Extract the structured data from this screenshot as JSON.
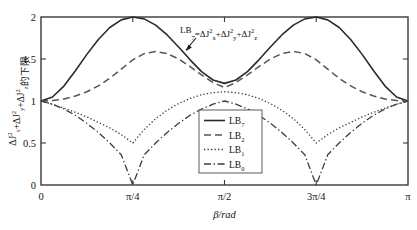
{
  "chart_data": {
    "type": "line",
    "title": "",
    "xlabel": "β/rad",
    "ylabel": "ΔJ²ₓ+ΔJ²ᵧ+ΔJ²ᵩ的下限",
    "ylabel_parts": {
      "term1_base": "ΔJ",
      "term1_sup": "2",
      "term1_sub": "x",
      "plus1": "+",
      "term2_base": "ΔJ",
      "term2_sup": "2",
      "term2_sub": "y",
      "plus2": "+",
      "term3_base": "ΔJ",
      "term3_sup": "2",
      "term3_sub": "z",
      "suffix": "的下限"
    },
    "xlim": [
      0,
      3.14159265
    ],
    "ylim": [
      0,
      2
    ],
    "xtick_values": [
      0,
      0.78539816,
      1.57079633,
      2.35619449,
      3.14159265
    ],
    "xtick_labels": [
      "0",
      "π/4",
      "π/2",
      "3π/4",
      "π"
    ],
    "ytick_values": [
      0,
      0.5,
      1,
      1.5,
      2
    ],
    "ytick_labels": [
      "0",
      "0.5",
      "1",
      "1.5",
      "2"
    ],
    "grid": false,
    "legend_position": "center",
    "annotation": {
      "text": "LB₇=ΔJ²ₓ+ΔJ²ᵧ+ΔJ²ᵩ",
      "parts": {
        "lhs_base": "LB",
        "lhs_sub": "7",
        "eq": "=",
        "t1_base": "ΔJ",
        "t1_sup": "2",
        "t1_sub": "x",
        "p1": "+",
        "t2_base": "ΔJ",
        "t2_sup": "2",
        "t2_sub": "y",
        "p2": "+",
        "t3_base": "ΔJ",
        "t3_sup": "2",
        "t3_sub": "z"
      }
    },
    "series": [
      {
        "name": "LB7",
        "label_base": "LB",
        "label_sub": "7",
        "style": "solid",
        "color": "#2b2b2b",
        "width": 1.6,
        "x": [
          0,
          0.0982,
          0.1963,
          0.2945,
          0.3927,
          0.4909,
          0.589,
          0.6872,
          0.7854,
          0.8836,
          0.9817,
          1.0799,
          1.1781,
          1.2763,
          1.3744,
          1.4726,
          1.5708,
          1.669,
          1.7671,
          1.8653,
          1.9635,
          2.0617,
          2.1598,
          2.258,
          2.3562,
          2.4544,
          2.5525,
          2.6507,
          2.7489,
          2.8471,
          2.9452,
          3.0434,
          3.1416
        ],
        "y": [
          1.0,
          1.048,
          1.178,
          1.36,
          1.555,
          1.733,
          1.875,
          1.966,
          2.0,
          1.978,
          1.903,
          1.786,
          1.643,
          1.49,
          1.35,
          1.25,
          1.21,
          1.25,
          1.35,
          1.49,
          1.643,
          1.786,
          1.903,
          1.978,
          2.0,
          1.966,
          1.875,
          1.733,
          1.555,
          1.36,
          1.178,
          1.048,
          1.0
        ]
      },
      {
        "name": "LB2",
        "label_base": "LB",
        "label_sub": "2",
        "style": "dashed",
        "color": "#555555",
        "width": 1.5,
        "x": [
          0,
          0.0982,
          0.1963,
          0.2945,
          0.3927,
          0.4909,
          0.589,
          0.6872,
          0.7854,
          0.8836,
          0.9817,
          1.0799,
          1.1781,
          1.2763,
          1.3744,
          1.4726,
          1.5708,
          1.669,
          1.7671,
          1.8653,
          1.9635,
          2.0617,
          2.1598,
          2.258,
          2.3562,
          2.4544,
          2.5525,
          2.6507,
          2.7489,
          2.8471,
          2.9452,
          3.0434,
          3.1416
        ],
        "y": [
          1.0,
          1.005,
          1.025,
          1.06,
          1.11,
          1.18,
          1.27,
          1.38,
          1.49,
          1.565,
          1.59,
          1.565,
          1.5,
          1.41,
          1.31,
          1.22,
          1.16,
          1.22,
          1.31,
          1.41,
          1.5,
          1.565,
          1.59,
          1.565,
          1.49,
          1.38,
          1.27,
          1.18,
          1.11,
          1.06,
          1.025,
          1.005,
          1.0
        ]
      },
      {
        "name": "LB1",
        "label_base": "LB",
        "label_sub": "1",
        "style": "dotted",
        "color": "#3d3d3d",
        "width": 1.3,
        "x": [
          0,
          0.0982,
          0.1963,
          0.2945,
          0.3927,
          0.4909,
          0.589,
          0.6872,
          0.7854,
          0.8836,
          0.9817,
          1.0799,
          1.1781,
          1.2763,
          1.3744,
          1.4726,
          1.5708,
          1.669,
          1.7671,
          1.8653,
          1.9635,
          2.0617,
          2.1598,
          2.258,
          2.3562,
          2.4544,
          2.5525,
          2.6507,
          2.7489,
          2.8471,
          2.9452,
          3.0434,
          3.1416
        ],
        "y": [
          1.0,
          0.96,
          0.915,
          0.865,
          0.81,
          0.745,
          0.68,
          0.6,
          0.5,
          0.66,
          0.79,
          0.89,
          0.97,
          1.03,
          1.075,
          1.1,
          1.11,
          1.1,
          1.075,
          1.03,
          0.97,
          0.89,
          0.79,
          0.66,
          0.5,
          0.6,
          0.68,
          0.745,
          0.81,
          0.865,
          0.915,
          0.96,
          1.0
        ]
      },
      {
        "name": "LB0",
        "label_base": "LB",
        "label_sub": "0",
        "style": "dashdot",
        "color": "#3d3d3d",
        "width": 1.3,
        "x": [
          0,
          0.0982,
          0.1963,
          0.2945,
          0.3927,
          0.4909,
          0.589,
          0.6872,
          0.7854,
          0.8836,
          0.9817,
          1.0799,
          1.1781,
          1.2763,
          1.3744,
          1.4726,
          1.5708,
          1.669,
          1.7671,
          1.8653,
          1.9635,
          2.0617,
          2.1598,
          2.258,
          2.3562,
          2.4544,
          2.5525,
          2.6507,
          2.7489,
          2.8471,
          2.9452,
          3.0434,
          3.1416
        ],
        "y": [
          1.0,
          0.962,
          0.905,
          0.83,
          0.735,
          0.625,
          0.5,
          0.36,
          0.0,
          0.36,
          0.5,
          0.625,
          0.735,
          0.83,
          0.905,
          0.962,
          1.0,
          0.962,
          0.905,
          0.83,
          0.735,
          0.625,
          0.5,
          0.36,
          0.0,
          0.36,
          0.5,
          0.625,
          0.735,
          0.83,
          0.905,
          0.962,
          1.0
        ]
      }
    ]
  }
}
